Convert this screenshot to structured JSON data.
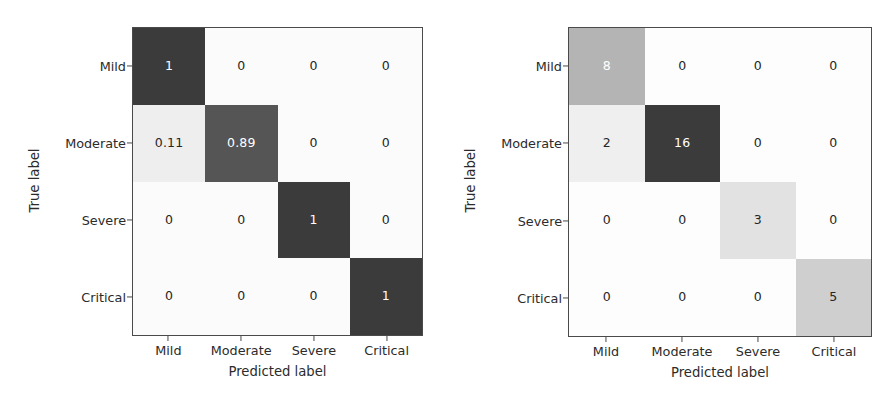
{
  "figure": {
    "axis_labels": {
      "x": "Predicted label",
      "y": "True label"
    },
    "classes": [
      "Mild",
      "Moderate",
      "Severe",
      "Critical"
    ],
    "colors": {
      "cmap_max": "#3b3b3b",
      "cmap_min": "#fbfbfb",
      "axis_line": "#4a4a4a",
      "text_dark": "#262626",
      "text_light": "#ffffff"
    }
  },
  "chart_data": [
    {
      "type": "heatmap",
      "title": "",
      "subtitle": "",
      "normalized": true,
      "xlabel": "Predicted label",
      "ylabel": "True label",
      "x_tick_labels": [
        "Mild",
        "Moderate",
        "Severe",
        "Critical"
      ],
      "y_tick_labels": [
        "Mild",
        "Moderate",
        "Severe",
        "Critical"
      ],
      "grid": false,
      "legend": "none",
      "colorbar": false,
      "vmin": 0,
      "vmax": 1,
      "rows": [
        {
          "label": "Mild",
          "cells": [
            {
              "text": "1",
              "value": 1.0,
              "shade": "#3b3b3b",
              "text_color": "#ffffff"
            },
            {
              "text": "0",
              "value": 0.0,
              "shade": "#fbfbfb",
              "text_color": "#262626"
            },
            {
              "text": "0",
              "value": 0.0,
              "shade": "#fbfbfb",
              "text_color": "#262626"
            },
            {
              "text": "0",
              "value": 0.0,
              "shade": "#fbfbfb",
              "text_color": "#262626"
            }
          ]
        },
        {
          "label": "Moderate",
          "cells": [
            {
              "text": "0.11",
              "value": 0.11,
              "shade": "#eeeeee",
              "text_color": "#262626"
            },
            {
              "text": "0.89",
              "value": 0.89,
              "shade": "#555555",
              "text_color": "#ffffff"
            },
            {
              "text": "0",
              "value": 0.0,
              "shade": "#fbfbfb",
              "text_color": "#262626"
            },
            {
              "text": "0",
              "value": 0.0,
              "shade": "#fbfbfb",
              "text_color": "#262626"
            }
          ]
        },
        {
          "label": "Severe",
          "cells": [
            {
              "text": "0",
              "value": 0.0,
              "shade": "#fbfbfb",
              "text_color": "#262626"
            },
            {
              "text": "0",
              "value": 0.0,
              "shade": "#fbfbfb",
              "text_color": "#262626"
            },
            {
              "text": "1",
              "value": 1.0,
              "shade": "#3b3b3b",
              "text_color": "#ffffff"
            },
            {
              "text": "0",
              "value": 0.0,
              "shade": "#fbfbfb",
              "text_color": "#262626"
            }
          ]
        },
        {
          "label": "Critical",
          "cells": [
            {
              "text": "0",
              "value": 0.0,
              "shade": "#fbfbfb",
              "text_color": "#262626"
            },
            {
              "text": "0",
              "value": 0.0,
              "shade": "#fbfbfb",
              "text_color": "#262626"
            },
            {
              "text": "0",
              "value": 0.0,
              "shade": "#fbfbfb",
              "text_color": "#262626"
            },
            {
              "text": "1",
              "value": 1.0,
              "shade": "#3b3b3b",
              "text_color": "#ffffff"
            }
          ]
        }
      ]
    },
    {
      "type": "heatmap",
      "title": "",
      "subtitle": "",
      "normalized": false,
      "xlabel": "Predicted label",
      "ylabel": "True label",
      "x_tick_labels": [
        "Mild",
        "Moderate",
        "Severe",
        "Critical"
      ],
      "y_tick_labels": [
        "Mild",
        "Moderate",
        "Severe",
        "Critical"
      ],
      "grid": false,
      "legend": "none",
      "colorbar": false,
      "vmin": 0,
      "vmax": 16,
      "rows": [
        {
          "label": "Mild",
          "cells": [
            {
              "text": "8",
              "value": 8,
              "shade": "#b4b4b4",
              "text_color": "#ffffff"
            },
            {
              "text": "0",
              "value": 0,
              "shade": "#fdfdfd",
              "text_color": "#262626"
            },
            {
              "text": "0",
              "value": 0,
              "shade": "#fdfdfd",
              "text_color": "#262626"
            },
            {
              "text": "0",
              "value": 0,
              "shade": "#fdfdfd",
              "text_color": "#262626"
            }
          ]
        },
        {
          "label": "Moderate",
          "cells": [
            {
              "text": "2",
              "value": 2,
              "shade": "#efefef",
              "text_color": "#262626"
            },
            {
              "text": "16",
              "value": 16,
              "shade": "#3b3b3b",
              "text_color": "#ffffff"
            },
            {
              "text": "0",
              "value": 0,
              "shade": "#fdfdfd",
              "text_color": "#262626"
            },
            {
              "text": "0",
              "value": 0,
              "shade": "#fdfdfd",
              "text_color": "#262626"
            }
          ]
        },
        {
          "label": "Severe",
          "cells": [
            {
              "text": "0",
              "value": 0,
              "shade": "#fdfdfd",
              "text_color": "#262626"
            },
            {
              "text": "0",
              "value": 0,
              "shade": "#fdfdfd",
              "text_color": "#262626"
            },
            {
              "text": "3",
              "value": 3,
              "shade": "#e2e2e2",
              "text_color": "#262626"
            },
            {
              "text": "0",
              "value": 0,
              "shade": "#fdfdfd",
              "text_color": "#262626"
            }
          ]
        },
        {
          "label": "Critical",
          "cells": [
            {
              "text": "0",
              "value": 0,
              "shade": "#fdfdfd",
              "text_color": "#262626"
            },
            {
              "text": "0",
              "value": 0,
              "shade": "#fdfdfd",
              "text_color": "#262626"
            },
            {
              "text": "0",
              "value": 0,
              "shade": "#fdfdfd",
              "text_color": "#262626"
            },
            {
              "text": "5",
              "value": 5,
              "shade": "#cfcfcf",
              "text_color": "#262626"
            }
          ]
        }
      ]
    }
  ]
}
